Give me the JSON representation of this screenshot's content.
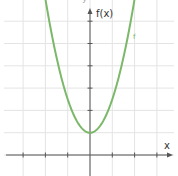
{
  "chart_data": {
    "type": "line",
    "title": "",
    "xlabel": "x",
    "ylabel": "f(x)",
    "function_label": "f",
    "function": "f(x) = 1.5x^2 + 1",
    "xlim": [
      -3.7,
      3.9
    ],
    "ylim": [
      -1.0,
      7.0
    ],
    "grid": true,
    "grid_step": 1,
    "series": [
      {
        "name": "f",
        "color": "#7bb86a",
        "x": [
          -2.0,
          -1.5,
          -1.0,
          -0.5,
          0.0,
          0.5,
          1.0,
          1.5,
          2.0
        ],
        "y": [
          7.0,
          4.375,
          2.5,
          1.375,
          1.0,
          1.375,
          2.5,
          4.375,
          7.0
        ]
      }
    ],
    "vertex": {
      "x": 0,
      "y": 1
    },
    "legend": null
  },
  "labels": {
    "title_fragment": "y",
    "y_axis": "f(x)",
    "x_axis": "x",
    "curve": "f"
  },
  "colors": {
    "curve": "#7bb86a",
    "grid": "#e4e4e4",
    "axis": "#555555"
  }
}
